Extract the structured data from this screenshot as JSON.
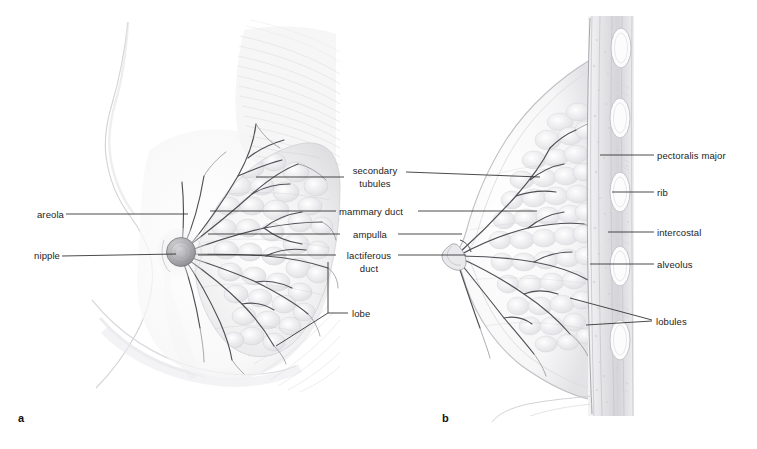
{
  "figure": {
    "background_color": "#ffffff",
    "label_color": "#1c1c1c",
    "leader_color": "#2b2b2b",
    "width": 757,
    "height": 449
  },
  "panels": [
    {
      "tag": "a",
      "x": 18,
      "y": 412,
      "description": "anterior dissected view of breast"
    },
    {
      "tag": "b",
      "x": 442,
      "y": 412,
      "description": "sagittal section of breast and chest wall"
    }
  ],
  "labels": {
    "areola": "areola",
    "nipple": "nipple",
    "secondary_tubules_line1": "secondary",
    "secondary_tubules_line2": "tubules",
    "mammary_duct": "mammary duct",
    "ampulla": "ampulla",
    "lactiferous_line1": "lactiferous",
    "lactiferous_line2": "duct",
    "lobe": "lobe",
    "pectoralis_major": "pectoralis major",
    "rib": "rib",
    "intercostal": "intercostal",
    "alveolus": "alveolus",
    "lobules": "lobules"
  },
  "colors": {
    "tissue_light": "#f2f2f3",
    "tissue_mid": "#dcdcde",
    "tissue_dark": "#b9b9bd",
    "duct_stroke": "#5d5d63",
    "skin_outline": "#c9c9cd",
    "rib_fill": "#fbfbfc",
    "rib_stroke": "#bdbdc2",
    "muscle_stripe": "#d6d6d9"
  }
}
